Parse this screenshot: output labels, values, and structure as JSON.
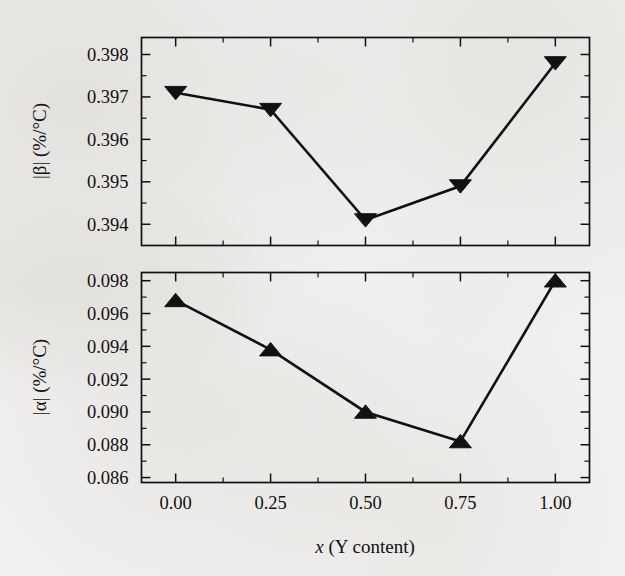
{
  "figure": {
    "background_color": "#f2f1ef",
    "ink_color": "#111111",
    "xlabel": "x (Y content)",
    "x_ticks": [
      "0.00",
      "0.25",
      "0.50",
      "0.75",
      "1.00"
    ],
    "x_tick_values": [
      0.0,
      0.25,
      0.5,
      0.75,
      1.0
    ]
  },
  "chart_data": [
    {
      "type": "line",
      "panel": "top",
      "title": "",
      "xlabel": "x (Y content)",
      "ylabel": "|β| (%/°C)",
      "marker": "triangle-down",
      "marker_color": "#111111",
      "line_color": "#111111",
      "grid": false,
      "legend": null,
      "xlim": [
        -0.09,
        1.09
      ],
      "ylim": [
        0.3935,
        0.3984
      ],
      "y_ticks": [
        "0.394",
        "0.395",
        "0.396",
        "0.397",
        "0.398"
      ],
      "y_tick_values": [
        0.394,
        0.395,
        0.396,
        0.397,
        0.398
      ],
      "y_minor_tick_count": 1,
      "x": [
        0.0,
        0.25,
        0.5,
        0.75,
        1.0
      ],
      "values": [
        0.3971,
        0.3967,
        0.3941,
        0.3949,
        0.3978
      ]
    },
    {
      "type": "line",
      "panel": "bottom",
      "title": "",
      "xlabel": "x (Y content)",
      "ylabel": "|α| (%/°C)",
      "marker": "triangle-up",
      "marker_color": "#111111",
      "line_color": "#111111",
      "grid": false,
      "legend": null,
      "xlim": [
        -0.09,
        1.09
      ],
      "ylim": [
        0.0857,
        0.0985
      ],
      "y_ticks": [
        "0.086",
        "0.088",
        "0.090",
        "0.092",
        "0.094",
        "0.096",
        "0.098"
      ],
      "y_tick_values": [
        0.086,
        0.088,
        0.09,
        0.092,
        0.094,
        0.096,
        0.098
      ],
      "y_minor_tick_count": 1,
      "x": [
        0.0,
        0.25,
        0.5,
        0.75,
        1.0
      ],
      "values": [
        0.0968,
        0.0938,
        0.09,
        0.0882,
        0.098
      ]
    }
  ]
}
